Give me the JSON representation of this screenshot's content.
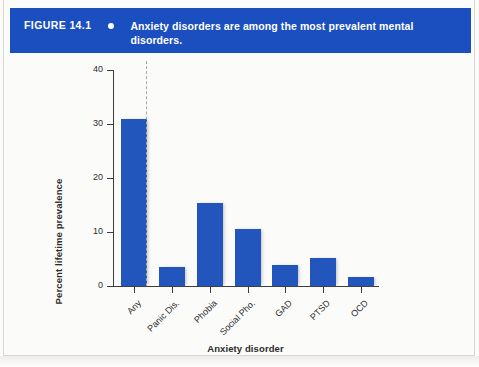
{
  "banner": {
    "figure_number": "FIGURE 14.1",
    "bullet_icon": "bullet-dot-icon",
    "caption": "Anxiety disorders are among the most prevalent mental disorders.",
    "background_color": "#1b4fc0",
    "text_color": "#ffffff"
  },
  "chart_data": {
    "type": "bar",
    "title": "Anxiety disorders are among the most prevalent mental disorders.",
    "xlabel": "Anxiety disorder",
    "ylabel": "Percent lifetime prevalence",
    "categories": [
      "Any",
      "Panic Dis.",
      "Phobia",
      "Social Pho.",
      "GAD",
      "PTSD",
      "OCD"
    ],
    "values": [
      31.0,
      3.5,
      15.3,
      10.5,
      3.9,
      5.2,
      1.7
    ],
    "ylim": [
      0,
      40
    ],
    "yticks": [
      0,
      10,
      20,
      30,
      40
    ],
    "ytick_labels": [
      "0",
      "10",
      "20",
      "30",
      "40"
    ],
    "grid": false,
    "legend": null,
    "bar_color": "#2256bd",
    "annotations": [
      {
        "type": "dashed-vertical-separator",
        "after_category": "Any",
        "color": "#a7a7a4"
      }
    ]
  }
}
